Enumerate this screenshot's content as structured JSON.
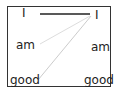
{
  "left_column": [
    {
      "text": "I"
    },
    {
      "text": "am"
    },
    {
      "text": "good"
    }
  ],
  "right_column": [
    {
      "text": "I"
    },
    {
      "text": "am"
    },
    {
      "text": "good"
    }
  ],
  "links": [
    {
      "from": "left.I",
      "to": "right.I",
      "strength": "strong",
      "color": "#222222"
    },
    {
      "from": "left.am",
      "to": "right.I",
      "strength": "weak",
      "color": "#dddddd"
    },
    {
      "from": "left.good",
      "to": "right.I",
      "strength": "weak",
      "color": "#cccccc"
    }
  ]
}
